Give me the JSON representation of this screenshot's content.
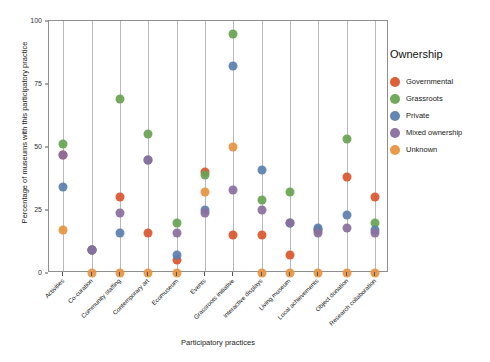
{
  "chart_data": {
    "type": "scatter",
    "title": "",
    "xlabel": "Participatory practices",
    "ylabel": "Percentage of museums with this participatory practice",
    "ylim": [
      0,
      100
    ],
    "yticks": [
      0,
      25,
      50,
      75,
      100
    ],
    "grid": "vertical",
    "legend_position": "right",
    "legend_title": "Ownership",
    "categories": [
      "Activities",
      "Co-curation",
      "Community staffing",
      "Contemporary art",
      "Ecomuseum",
      "Events",
      "Grassroots initiative",
      "Interactive displays",
      "Living museum",
      "Local achievements",
      "Object donation",
      "Research collaboration"
    ],
    "series": [
      {
        "name": "Governmental",
        "color": "#d9562c",
        "values": [
          47,
          9,
          30,
          16,
          5,
          40,
          15,
          15,
          7,
          17,
          38,
          30
        ]
      },
      {
        "name": "Grassroots",
        "color": "#68a353",
        "values": [
          51,
          9,
          69,
          55,
          20,
          39,
          95,
          29,
          32,
          17,
          53,
          20
        ]
      },
      {
        "name": "Private",
        "color": "#5b7fae",
        "values": [
          34,
          9,
          16,
          45,
          7,
          25,
          82,
          41,
          20,
          18,
          23,
          17
        ]
      },
      {
        "name": "Mixed ownership",
        "color": "#8a6f9e",
        "values": [
          47,
          9,
          24,
          45,
          16,
          24,
          33,
          25,
          20,
          16,
          18,
          16
        ]
      },
      {
        "name": "Unknown",
        "color": "#e79440",
        "values": [
          17,
          0,
          0,
          0,
          0,
          32,
          50,
          0,
          0,
          0,
          0,
          0
        ]
      }
    ]
  },
  "axes": {
    "y_label": "Percentage of museums with this participatory practice",
    "x_label": "Participatory practices",
    "y_tick_labels": [
      "0",
      "25",
      "50",
      "75",
      "100"
    ]
  },
  "legend": {
    "title": "Ownership",
    "items": [
      {
        "label": "Governmental",
        "color": "#d9562c"
      },
      {
        "label": "Grassroots",
        "color": "#68a353"
      },
      {
        "label": "Private",
        "color": "#5b7fae"
      },
      {
        "label": "Mixed ownership",
        "color": "#8a6f9e"
      },
      {
        "label": "Unknown",
        "color": "#e79440"
      }
    ]
  }
}
